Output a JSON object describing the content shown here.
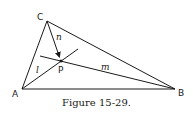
{
  "figure": {
    "caption": "Figure 15-29.",
    "vertices": [
      {
        "label": "A",
        "x": 22,
        "y": 89
      },
      {
        "label": "B",
        "x": 175,
        "y": 89
      },
      {
        "label": "C",
        "x": 47,
        "y": 21
      }
    ],
    "point": {
      "label": "P",
      "x": 61,
      "y": 61
    },
    "lines": [
      {
        "label": "l"
      },
      {
        "label": "m"
      },
      {
        "label": "n"
      }
    ]
  }
}
